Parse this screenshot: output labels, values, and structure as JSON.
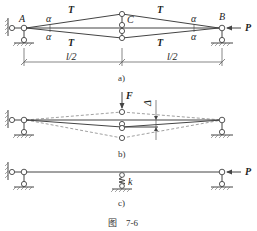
{
  "figure": {
    "caption": "图　7-6",
    "panels": [
      {
        "id": "a",
        "label": "a)",
        "points": {
          "A": "A",
          "B": "B",
          "C": "C"
        },
        "tension_label": "T",
        "angle_label": "α",
        "force_label": "P",
        "dimension_left": "l/2",
        "dimension_right": "l/2"
      },
      {
        "id": "b",
        "label": "b)",
        "force_label": "F",
        "displacement_label": "Δ"
      },
      {
        "id": "c",
        "label": "c)",
        "spring_label": "k",
        "force_label": "P"
      }
    ]
  }
}
